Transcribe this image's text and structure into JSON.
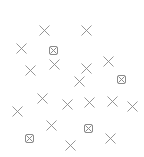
{
  "canvas": {
    "width": 144,
    "height": 157,
    "background": "#ffffff",
    "stroke_color": "#8a8a8a"
  },
  "markers": [
    {
      "type": "cross",
      "x": 44,
      "y": 30
    },
    {
      "type": "cross",
      "x": 86,
      "y": 30
    },
    {
      "type": "cross",
      "x": 21,
      "y": 48
    },
    {
      "type": "boxed-cross",
      "x": 53,
      "y": 50
    },
    {
      "type": "cross",
      "x": 54,
      "y": 64
    },
    {
      "type": "cross",
      "x": 108,
      "y": 61
    },
    {
      "type": "cross",
      "x": 30,
      "y": 70
    },
    {
      "type": "cross",
      "x": 86,
      "y": 68
    },
    {
      "type": "cross",
      "x": 79,
      "y": 81
    },
    {
      "type": "boxed-cross",
      "x": 121,
      "y": 79
    },
    {
      "type": "cross",
      "x": 42,
      "y": 98
    },
    {
      "type": "cross",
      "x": 67,
      "y": 104
    },
    {
      "type": "cross",
      "x": 89,
      "y": 102
    },
    {
      "type": "cross",
      "x": 112,
      "y": 101
    },
    {
      "type": "cross",
      "x": 132,
      "y": 106
    },
    {
      "type": "cross",
      "x": 17,
      "y": 111
    },
    {
      "type": "cross",
      "x": 51,
      "y": 125
    },
    {
      "type": "boxed-cross",
      "x": 88,
      "y": 128
    },
    {
      "type": "boxed-cross",
      "x": 29,
      "y": 138
    },
    {
      "type": "cross",
      "x": 110,
      "y": 138
    },
    {
      "type": "cross",
      "x": 70,
      "y": 145
    }
  ]
}
